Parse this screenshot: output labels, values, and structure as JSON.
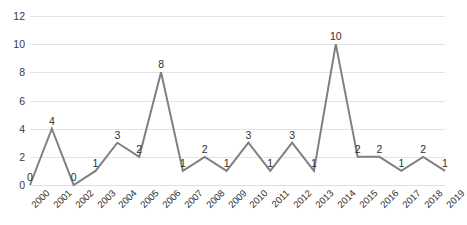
{
  "chart_data": {
    "type": "line",
    "title": "",
    "subtitle": "",
    "xlabel": "",
    "ylabel": "",
    "categories": [
      "2000",
      "2001",
      "2002",
      "2003",
      "2004",
      "2005",
      "2006",
      "2007",
      "2008",
      "2009",
      "2010",
      "2011",
      "2012",
      "2013",
      "2014",
      "2015",
      "2016",
      "2017",
      "2018",
      "2019"
    ],
    "values": [
      0,
      4,
      0,
      1,
      3,
      2,
      8,
      1,
      2,
      1,
      3,
      1,
      3,
      1,
      10,
      2,
      2,
      1,
      2,
      1
    ],
    "series": [
      {
        "name": "",
        "values": [
          0,
          4,
          0,
          1,
          3,
          2,
          8,
          1,
          2,
          1,
          3,
          1,
          3,
          1,
          10,
          2,
          2,
          1,
          2,
          1
        ]
      }
    ],
    "point_labels": [
      "0",
      "4",
      "0",
      "1",
      "3",
      "2",
      "8",
      "1",
      "2",
      "1",
      "3",
      "1",
      "3",
      "1",
      "10",
      "2",
      "2",
      "1",
      "2",
      "1"
    ],
    "ylim": [
      0,
      12
    ],
    "yticks": [
      0,
      2,
      4,
      6,
      8,
      10,
      12
    ],
    "ytick_labels": [
      "0",
      "2",
      "4",
      "6",
      "8",
      "10",
      "12"
    ],
    "grid": true,
    "legend": false,
    "legend_position": "none",
    "line_color": "#808080",
    "grid_color": "#e4e4e4",
    "background_color": "#ffffff",
    "text_color": "#2f2f2f",
    "xtick_rotation": -45,
    "markers": false,
    "line_width": 2
  }
}
